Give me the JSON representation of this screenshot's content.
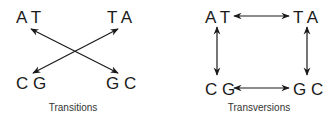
{
  "panels": [
    {
      "caption": "Transitions",
      "pairs": {
        "top_left": "A T",
        "top_right": "T A",
        "bottom_left": "C G",
        "bottom_right": "G C"
      },
      "arrows": [
        "top_left ↔ bottom_right",
        "top_right ↔ bottom_left"
      ]
    },
    {
      "caption": "Transversions",
      "pairs": {
        "top_left": "A T",
        "top_right": "T A",
        "bottom_left": "C G",
        "bottom_right": "G C"
      },
      "arrows": [
        "top_left ↔ top_right",
        "top_left ↔ bottom_left",
        "top_right ↔ bottom_right",
        "bottom_left ↔ bottom_right"
      ]
    }
  ],
  "colors": {
    "ink": "#1a1a1a",
    "caption": "#333333"
  }
}
